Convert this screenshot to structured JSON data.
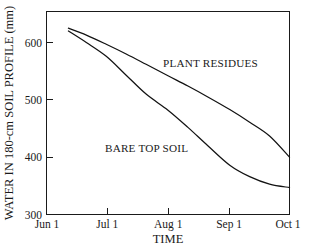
{
  "chart_data": {
    "type": "line",
    "title": "",
    "xlabel": "TIME",
    "ylabel": "WATER IN 180-cm SOIL PROFILE (mm)",
    "xlim": [
      "Jun 1",
      "Oct 1"
    ],
    "ylim": [
      300,
      640
    ],
    "grid": false,
    "legend_position": "inline-annotations",
    "x_tick_labels": [
      "Jun 1",
      "Jul 1",
      "Aug 1",
      "Sep 1",
      "Oct 1"
    ],
    "y_tick_labels": [
      "300",
      "400",
      "500",
      "600"
    ],
    "y_ticks": [
      300,
      400,
      500,
      600
    ],
    "x_ticks_days_from_jun1": [
      0,
      30,
      61,
      92,
      122
    ],
    "series": [
      {
        "name": "PLANT RESIDUES",
        "annotation": "PLANT RESIDUES",
        "x_days_from_jun1": [
          11,
          20,
          30,
          40,
          50,
          61,
          71,
          81,
          92,
          102,
          112,
          122
        ],
        "values": [
          625,
          613,
          597,
          580,
          562,
          542,
          524,
          505,
          483,
          461,
          437,
          400
        ]
      },
      {
        "name": "BARE TOP SOIL",
        "annotation": "BARE TOP SOIL",
        "x_days_from_jun1": [
          11,
          20,
          30,
          40,
          50,
          61,
          71,
          81,
          92,
          102,
          112,
          122
        ],
        "values": [
          620,
          600,
          576,
          543,
          510,
          482,
          452,
          420,
          386,
          366,
          353,
          347
        ]
      }
    ],
    "annotations": [
      {
        "text": "PLANT RESIDUES",
        "series": "PLANT RESIDUES"
      },
      {
        "text": "BARE TOP SOIL",
        "series": "BARE TOP SOIL"
      }
    ]
  }
}
